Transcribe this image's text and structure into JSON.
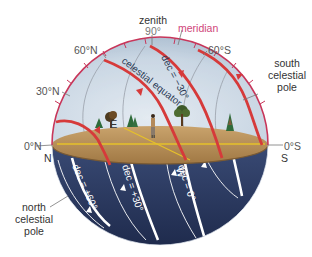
{
  "figure": {
    "labels": {
      "zenith": "zenith",
      "zenith_altitude": "90°",
      "meridian": "meridian",
      "lat_60N": "60°N",
      "lat_30N": "30°N",
      "lat_0N": "0°N",
      "lat_60S": "60°S",
      "lat_0S": "0°S",
      "dir_N": "N",
      "dir_S": "S",
      "dir_E": "E",
      "dir_W": "W",
      "south_pole": [
        "south",
        "celestial",
        "pole"
      ],
      "north_pole": [
        "north",
        "celestial",
        "pole"
      ],
      "celestial_equator": "celestial equator",
      "dec_minus30": "dec = −30°",
      "dec_plus60": "dec = +60°",
      "dec_plus30": "dec = +30°",
      "dec_0": "dec = 0°"
    },
    "colors": {
      "sky": "#c9d6e3",
      "sky_edge": "#a9bccf",
      "ground": "#b8935f",
      "ground_dark": "#8e6a3c",
      "below_horizon": "#2e3e66",
      "below_horizon_dark": "#1f2b4d",
      "meridian": "#c8365a",
      "star_path_above": "#d63a3a",
      "star_path_below": "#ffffff",
      "horizon_line": "#e6c12a",
      "label_text": "#555555",
      "meridian_label": "#d0457a"
    }
  }
}
